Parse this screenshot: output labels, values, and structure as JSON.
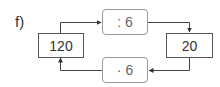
{
  "problem_label": "f)",
  "nodes": {
    "left_value": "120",
    "right_value": "20",
    "top_operation": ": 6",
    "bottom_operation": "· 6"
  },
  "colors": {
    "line": "#444444",
    "value_border": "#555555",
    "op_border": "#999999"
  }
}
